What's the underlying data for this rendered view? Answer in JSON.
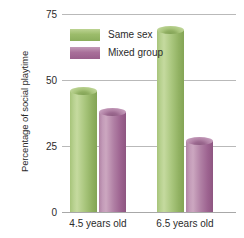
{
  "chart_data": {
    "type": "bar",
    "title": "",
    "xlabel": "",
    "ylabel": "Percentage of social playtime",
    "categories": [
      "4.5 years old",
      "6.5 years old"
    ],
    "series": [
      {
        "name": "Same sex",
        "color": "#9cbc6b",
        "values": [
          46,
          69
        ]
      },
      {
        "name": "Mixed group",
        "color": "#a9709a",
        "values": [
          38,
          27
        ]
      }
    ],
    "ylim": [
      0,
      75
    ],
    "yticks": [
      0,
      25,
      50,
      75
    ],
    "ytick_labels": [
      "0",
      "25",
      "50",
      "75"
    ],
    "grid": true,
    "legend_position": "top-left"
  }
}
